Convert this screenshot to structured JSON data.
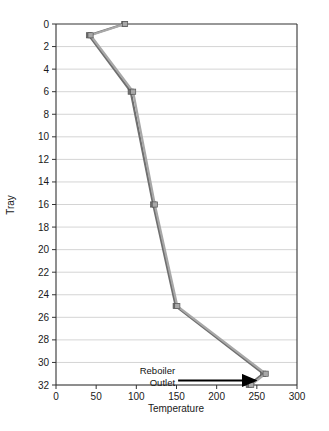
{
  "chart_data": {
    "type": "line",
    "title": "",
    "xlabel": "Temperature",
    "ylabel": "Tray",
    "xlim": [
      0,
      300
    ],
    "ylim": [
      0,
      32
    ],
    "y_inverted": true,
    "grid": "horizontal",
    "legend": "none",
    "x_ticks": [
      0,
      50,
      100,
      150,
      200,
      250,
      300
    ],
    "y_ticks": [
      0,
      2,
      4,
      6,
      8,
      10,
      12,
      14,
      16,
      18,
      20,
      22,
      24,
      26,
      28,
      30,
      32
    ],
    "series": [
      {
        "name": "series-dark",
        "color": "#6f6f6f",
        "marker": "square",
        "points": [
          {
            "tray": 0,
            "temperature": 85
          },
          {
            "tray": 1,
            "temperature": 41
          },
          {
            "tray": 6,
            "temperature": 93
          },
          {
            "tray": 16,
            "temperature": 121
          },
          {
            "tray": 25,
            "temperature": 149
          },
          {
            "tray": 31,
            "temperature": 258
          },
          {
            "tray": 32,
            "temperature": 240
          }
        ]
      },
      {
        "name": "series-light",
        "color": "#a8a8a8",
        "marker": "square",
        "points": [
          {
            "tray": 0,
            "temperature": 86
          },
          {
            "tray": 1,
            "temperature": 43
          },
          {
            "tray": 6,
            "temperature": 96
          },
          {
            "tray": 16,
            "temperature": 123
          },
          {
            "tray": 25,
            "temperature": 151
          },
          {
            "tray": 31,
            "temperature": 261
          },
          {
            "tray": 32,
            "temperature": 243
          }
        ]
      }
    ],
    "annotations": [
      {
        "name": "reboiler-outlet",
        "line1": "Reboiler",
        "line2": "Outlet",
        "arrow_from": {
          "temperature": 152,
          "tray": 31.6
        },
        "arrow_to": {
          "temperature": 248,
          "tray": 31.6
        }
      }
    ]
  },
  "axes": {
    "x_title": "Temperature",
    "y_title": "Tray",
    "x_tick_labels": [
      "0",
      "50",
      "100",
      "150",
      "200",
      "250",
      "300"
    ],
    "y_tick_labels": [
      "0",
      "2",
      "4",
      "6",
      "8",
      "10",
      "12",
      "14",
      "16",
      "18",
      "20",
      "22",
      "24",
      "26",
      "28",
      "30",
      "32"
    ]
  },
  "colors": {
    "axis": "#333333",
    "grid": "#c9c9c9",
    "series_dark": "#6f6f6f",
    "series_light": "#a8a8a8",
    "arrow": "#000000",
    "background": "#ffffff"
  }
}
